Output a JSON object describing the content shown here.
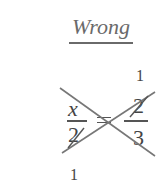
{
  "title": "Wrong",
  "equation": {
    "left": {
      "numerator": "x",
      "denominator": "2"
    },
    "equals": "=",
    "right": {
      "numerator": "2",
      "denominator": "3"
    },
    "cancel_annotation_top": "1",
    "cancel_annotation_bottom": "1"
  },
  "colors": {
    "text": "#444444",
    "strike": "#666666"
  }
}
